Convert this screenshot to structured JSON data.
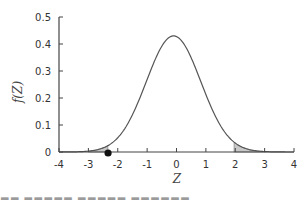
{
  "chart_data": {
    "type": "area",
    "title": "",
    "xlabel": "Z",
    "ylabel": "f(Z)",
    "xlim": [
      -4,
      4
    ],
    "ylim": [
      0,
      0.5
    ],
    "x_ticks": [
      -4,
      -3,
      -2,
      -1,
      0,
      1,
      2,
      3,
      4
    ],
    "y_ticks": [
      0,
      0.1,
      0.2,
      0.3,
      0.4,
      0.5
    ],
    "x_tick_labels": [
      "-4",
      "-3",
      "-2",
      "-1",
      "0",
      "1",
      "2",
      "3",
      "4"
    ],
    "y_tick_labels": [
      "0",
      "0.1",
      "0.2",
      "0.3",
      "0.4",
      "0.5"
    ],
    "grid": false,
    "legend": null,
    "series": [
      {
        "name": "normal density curve",
        "distribution": "normal",
        "mean": -0.1,
        "peak_value": 0.43,
        "x": [
          -4,
          -3.5,
          -3,
          -2.5,
          -2.33,
          -2,
          -1.5,
          -1,
          -0.5,
          0,
          0.5,
          1,
          1.5,
          1.96,
          2.5,
          3,
          3.5,
          4
        ],
        "values": [
          0.0,
          0.001,
          0.005,
          0.02,
          0.03,
          0.06,
          0.13,
          0.24,
          0.36,
          0.43,
          0.36,
          0.24,
          0.13,
          0.06,
          0.02,
          0.005,
          0.001,
          0.0
        ]
      }
    ],
    "shaded_regions": [
      {
        "name": "left-tail",
        "from": -3.0,
        "to": -2.33,
        "color": "#c8c8c8"
      },
      {
        "name": "right-tail",
        "from": 1.96,
        "to": 3.0,
        "color": "#c8c8c8"
      }
    ],
    "annotations": [
      {
        "type": "point-marker",
        "x": -2.33,
        "y": 0,
        "color": "#111111"
      }
    ]
  },
  "colors": {
    "curve": "#555555",
    "axis": "#444444",
    "shade": "#c8c8c8",
    "marker": "#111111",
    "text": "#333333"
  },
  "caption": {
    "text": "▬▬ ▬▬▬▬▬ ▬▬▬▬▬ ▬▬▬▬▬▬"
  }
}
